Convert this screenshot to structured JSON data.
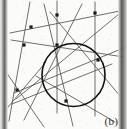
{
  "figure": {
    "caption": "(b)",
    "background_color": "#fbfbfa",
    "line_color": "#4a4a4a",
    "circle_color": "#111111",
    "vertex_color": "#1a1a1a",
    "scan_edge_color": "#575756",
    "width": 127,
    "height": 129
  },
  "chart_data": {
    "type": "diagram",
    "title": "",
    "subtitle": "",
    "xlabel": "",
    "ylabel": "",
    "annotations": [
      "(b)"
    ],
    "viewbox": [
      0,
      0,
      127,
      129
    ],
    "circle": {
      "cx": 73.5,
      "cy": 75.0,
      "r": 31.5,
      "stroke": "#111111",
      "stroke_width": 1.6
    },
    "lines": [
      {
        "name": "line-1",
        "x1": 11,
        "y1": 40,
        "x2": 124,
        "y2": 57
      },
      {
        "name": "line-2",
        "x1": 10,
        "y1": 33,
        "x2": 120,
        "y2": 11
      },
      {
        "name": "line-3",
        "x1": 14,
        "y1": 93,
        "x2": 126,
        "y2": 47
      },
      {
        "name": "line-4",
        "x1": 16,
        "y1": 99,
        "x2": 119,
        "y2": 14
      },
      {
        "name": "line-5",
        "x1": 12,
        "y1": 104,
        "x2": 112,
        "y2": 64
      },
      {
        "name": "line-6",
        "x1": 30,
        "y1": 2,
        "x2": 9,
        "y2": 121
      },
      {
        "name": "line-7",
        "x1": 57,
        "y1": 1,
        "x2": 57,
        "y2": 113
      },
      {
        "name": "line-8",
        "x1": 95,
        "y1": 2,
        "x2": 95,
        "y2": 116
      },
      {
        "name": "line-9",
        "x1": 44,
        "y1": 4,
        "x2": 73,
        "y2": 126
      },
      {
        "name": "line-10",
        "x1": 82,
        "y1": 4,
        "x2": 24,
        "y2": 120
      },
      {
        "name": "line-11",
        "x1": 120,
        "y1": 96,
        "x2": 50,
        "y2": 12
      },
      {
        "name": "line-12",
        "x1": 36,
        "y1": 76,
        "x2": 115,
        "y2": 122
      },
      {
        "name": "line-13",
        "x1": 6,
        "y1": 72,
        "x2": 44,
        "y2": 127
      },
      {
        "name": "line-14",
        "x1": 3,
        "y1": 113,
        "x2": 46,
        "y2": 62
      }
    ],
    "vertices": [
      {
        "name": "vertex-top-left",
        "x": 31,
        "y": 27
      },
      {
        "name": "vertex-left-mid",
        "x": 24,
        "y": 45
      },
      {
        "name": "vertex-top-center",
        "x": 57,
        "y": 15
      },
      {
        "name": "vertex-top-right",
        "x": 95,
        "y": 13
      },
      {
        "name": "vertex-circle-top",
        "x": 57,
        "y": 45
      },
      {
        "name": "vertex-circle-right",
        "x": 98,
        "y": 60
      },
      {
        "name": "vertex-circle-bottom",
        "x": 66,
        "y": 101
      },
      {
        "name": "vertex-lower-left",
        "x": 17,
        "y": 90
      }
    ]
  }
}
